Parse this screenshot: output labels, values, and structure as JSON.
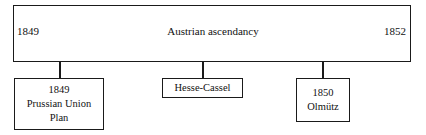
{
  "diagram": {
    "type": "timeline",
    "period": {
      "start_year": "1849",
      "title": "Austrian ascendancy",
      "end_year": "1852"
    },
    "events": [
      {
        "name": "prussian-union-plan",
        "lines": [
          "1849",
          "Prussian Union",
          "Plan"
        ],
        "line1": "1849",
        "line2": "Prussian Union",
        "line3": "Plan"
      },
      {
        "name": "hesse-cassel",
        "lines": [
          "Hesse-Cassel"
        ],
        "line1": "Hesse-Cassel"
      },
      {
        "name": "olmutz",
        "lines": [
          "1850",
          "Olmütz"
        ],
        "line1": "1850",
        "line2": "Olmütz"
      }
    ]
  },
  "colors": {
    "border": "#1a1a1a",
    "text": "#111111",
    "background": "#ffffff"
  }
}
